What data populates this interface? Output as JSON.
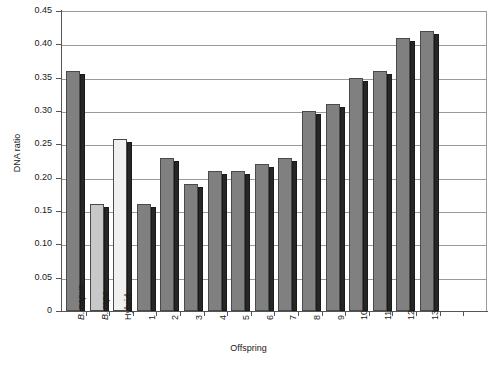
{
  "chart_data": {
    "type": "bar",
    "title": "",
    "xlabel": "Offspring",
    "ylabel": "DNA ratio",
    "ylim": [
      0,
      0.45
    ],
    "ytick_step": 0.05,
    "ytick_labels": [
      "0.45",
      "0.40",
      "0.35",
      "0.30",
      "0.25",
      "0.20",
      "0.15",
      "0.10",
      "0.05",
      "0"
    ],
    "ytick_values": [
      0.45,
      0.4,
      0.35,
      0.3,
      0.25,
      0.2,
      0.15,
      0.1,
      0.05,
      0
    ],
    "grid": true,
    "legend": "none",
    "categories": [
      "B. napus",
      "B. rapa",
      "Hybrid",
      "1",
      "2",
      "3",
      "4",
      "5",
      "6",
      "7",
      "8",
      "9",
      "10",
      "11",
      "12",
      "13"
    ],
    "values": [
      0.36,
      0.16,
      0.258,
      0.16,
      0.23,
      0.19,
      0.21,
      0.21,
      0.22,
      0.23,
      0.3,
      0.31,
      0.35,
      0.36,
      0.41,
      0.42
    ],
    "bars": [
      {
        "label": "B. napus",
        "value": 0.36,
        "italic": true,
        "fill": "#808080"
      },
      {
        "label": "B. rapa",
        "value": 0.16,
        "italic": true,
        "fill": "#c8c8c8"
      },
      {
        "label": "Hybrid",
        "value": 0.258,
        "italic": false,
        "fill": "#f0f0f0"
      },
      {
        "label": "1",
        "value": 0.16,
        "italic": false,
        "fill": "#808080"
      },
      {
        "label": "2",
        "value": 0.23,
        "italic": false,
        "fill": "#808080"
      },
      {
        "label": "3",
        "value": 0.19,
        "italic": false,
        "fill": "#808080"
      },
      {
        "label": "4",
        "value": 0.21,
        "italic": false,
        "fill": "#808080"
      },
      {
        "label": "5",
        "value": 0.21,
        "italic": false,
        "fill": "#808080"
      },
      {
        "label": "6",
        "value": 0.22,
        "italic": false,
        "fill": "#808080"
      },
      {
        "label": "7",
        "value": 0.23,
        "italic": false,
        "fill": "#808080"
      },
      {
        "label": "8",
        "value": 0.3,
        "italic": false,
        "fill": "#808080"
      },
      {
        "label": "9",
        "value": 0.31,
        "italic": false,
        "fill": "#808080"
      },
      {
        "label": "10",
        "value": 0.35,
        "italic": false,
        "fill": "#808080"
      },
      {
        "label": "11",
        "value": 0.36,
        "italic": false,
        "fill": "#808080"
      },
      {
        "label": "12",
        "value": 0.41,
        "italic": false,
        "fill": "#808080"
      },
      {
        "label": "13",
        "value": 0.42,
        "italic": false,
        "fill": "#808080"
      }
    ],
    "colors": {
      "napus_fill": "#808080",
      "rapa_fill": "#c8c8c8",
      "hybrid_fill": "#f0f0f0",
      "offspring_fill": "#808080",
      "bar_outline": "#4a4a4a",
      "bar_shadow": "#262626",
      "gridline": "#9a9a9a",
      "axis": "#555555",
      "text": "#1a1a1a",
      "background": "#ffffff"
    }
  }
}
